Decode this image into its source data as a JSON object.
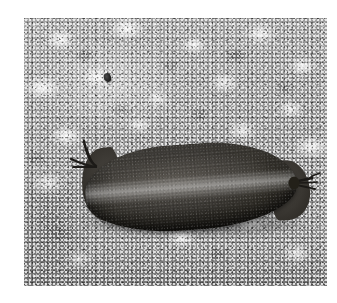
{
  "page": {
    "kind": "photograph",
    "color_mode": "black-and-white",
    "canvas_width_px": 337,
    "canvas_height_px": 303,
    "margin_color": "#ffffff"
  },
  "photo": {
    "left_px": 24,
    "top_px": 18,
    "width_px": 303,
    "height_px": 268,
    "caption": "",
    "subject": "cured sausage on stone surface"
  },
  "scene": {
    "background": {
      "name": "speckled stone surface",
      "description": "coarse mottled granite or weathered concrete with bright white flecks over mid-grey",
      "base_color": "#9d9d9d",
      "light_fleck_color": "#ffffff",
      "dark_fleck_color": "#1e1e1e"
    },
    "speck": {
      "name": "small dark speck",
      "description": "isolated dark pebble or debris on the stone, upper-left of frame",
      "color": "#262626"
    }
  },
  "subject": {
    "name": "sausage",
    "description": "dark elongated cured sausage lying horizontally, slightly tilted, with twisted casing tied at both ends",
    "body_color": "#46433e",
    "shadow_color": "#141414",
    "highlight_color": "#b4b0a8",
    "orientation": "horizontal",
    "tilt_degrees": -4.2,
    "parts": {
      "body_label": "sausage body",
      "highlight_label": "longitudinal specular highlight",
      "left_end_label": "left rounded end",
      "right_end_label": "right tapered end",
      "left_tie_label": "left casing tie strands",
      "right_tie_label": "right casing tie strands",
      "shadow_label": "cast shadow"
    }
  }
}
